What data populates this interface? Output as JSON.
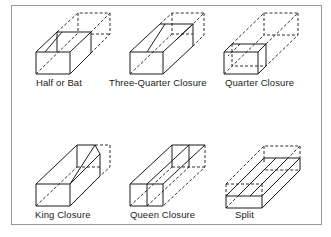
{
  "figure": {
    "items": [
      {
        "label": "Half or Bat"
      },
      {
        "label": "Three-Quarter Closure"
      },
      {
        "label": "Quarter Closure"
      },
      {
        "label": "King Closure"
      },
      {
        "label": "Queen Closure"
      },
      {
        "label": "Split"
      }
    ]
  },
  "colors": {
    "ink": "#1a1a1a",
    "frame": "#9a9a9a",
    "background": "#ffffff"
  }
}
